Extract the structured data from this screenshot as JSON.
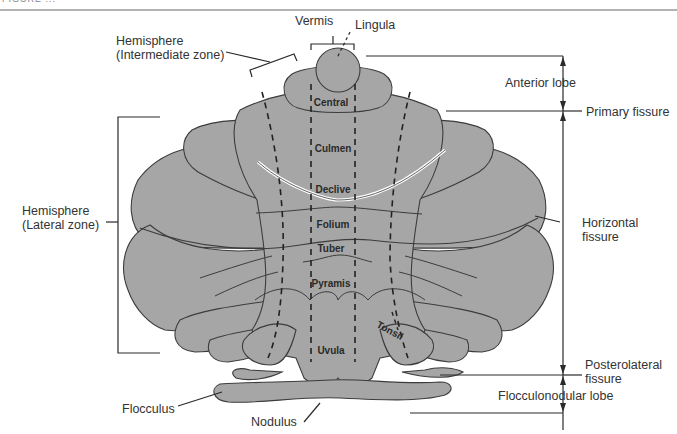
{
  "header": {
    "caption_fragment": "FIGURE ..."
  },
  "diagram": {
    "colors": {
      "tissue": "#a6a6a6",
      "outline": "#3c3c3c",
      "line": "#2a2a2a",
      "background": "#ffffff",
      "primary_fissure_highlight": "#ffffff"
    },
    "vermis_lobules": [
      {
        "id": "central",
        "label": "Central"
      },
      {
        "id": "culmen",
        "label": "Culmen"
      },
      {
        "id": "declive",
        "label": "Declive"
      },
      {
        "id": "folium",
        "label": "Folium"
      },
      {
        "id": "tuber",
        "label": "Tuber"
      },
      {
        "id": "pyramis",
        "label": "Pyramis"
      },
      {
        "id": "uvula",
        "label": "Uvula"
      },
      {
        "id": "tonsil",
        "label": "Tonsil"
      }
    ],
    "labels": {
      "vermis": "Vermis",
      "lingula": "Lingula",
      "hemisphere_intermediate_1": "Hemisphere",
      "hemisphere_intermediate_2": "(Intermediate zone)",
      "hemisphere_lateral_1": "Hemisphere",
      "hemisphere_lateral_2": "(Lateral zone)",
      "anterior_lobe": "Anterior lobe",
      "primary_fissure": "Primary fissure",
      "horizontal_fissure_1": "Horizontal",
      "horizontal_fissure_2": "fissure",
      "posterolateral_fissure_1": "Posterolateral",
      "posterolateral_fissure_2": "fissure",
      "flocculonodular_lobe": "Flocculonodular lobe",
      "flocculus": "Flocculus",
      "nodulus": "Nodulus"
    }
  }
}
